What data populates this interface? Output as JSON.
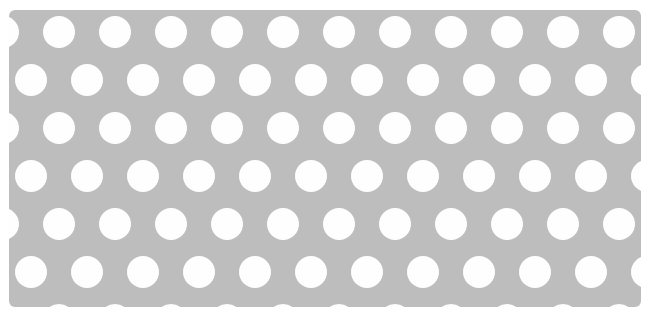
{
  "image": {
    "title": "Polka Dot Pattern Swatch",
    "description": "Gray rectangular fabric swatch covered with a staggered grid of white polka dots, photographed on a white background.",
    "canvas": {
      "width": 666,
      "height": 333,
      "background_color": "#ffffff"
    }
  },
  "panel": {
    "name": "polka-dot-swatch",
    "x": 9,
    "y": 10,
    "width": 632,
    "height": 297,
    "background_color": "#bdbdbd",
    "corner_radius": 6
  },
  "pattern": {
    "type": "staggered-dot-grid",
    "dot_color": "#fefefe",
    "dot_diameter": 32,
    "dot_radius": 16,
    "column_spacing": 56,
    "row_spacing": 48,
    "row_offset": 28,
    "first_row_center_y": 22,
    "first_column_center_x": 22,
    "rows": 7,
    "columns_even_rows": 12,
    "columns_odd_rows": 12,
    "edge_clipping": "dots are cropped by the panel edges on top, bottom, left and right"
  },
  "colors": {
    "background": "#ffffff",
    "panel_gray": "#bdbdbd",
    "dot_white": "#fefefe",
    "edge_shadow": "#d6d6d6"
  },
  "meta": {
    "dot_count_visible": 84,
    "orientation": "landscape"
  }
}
